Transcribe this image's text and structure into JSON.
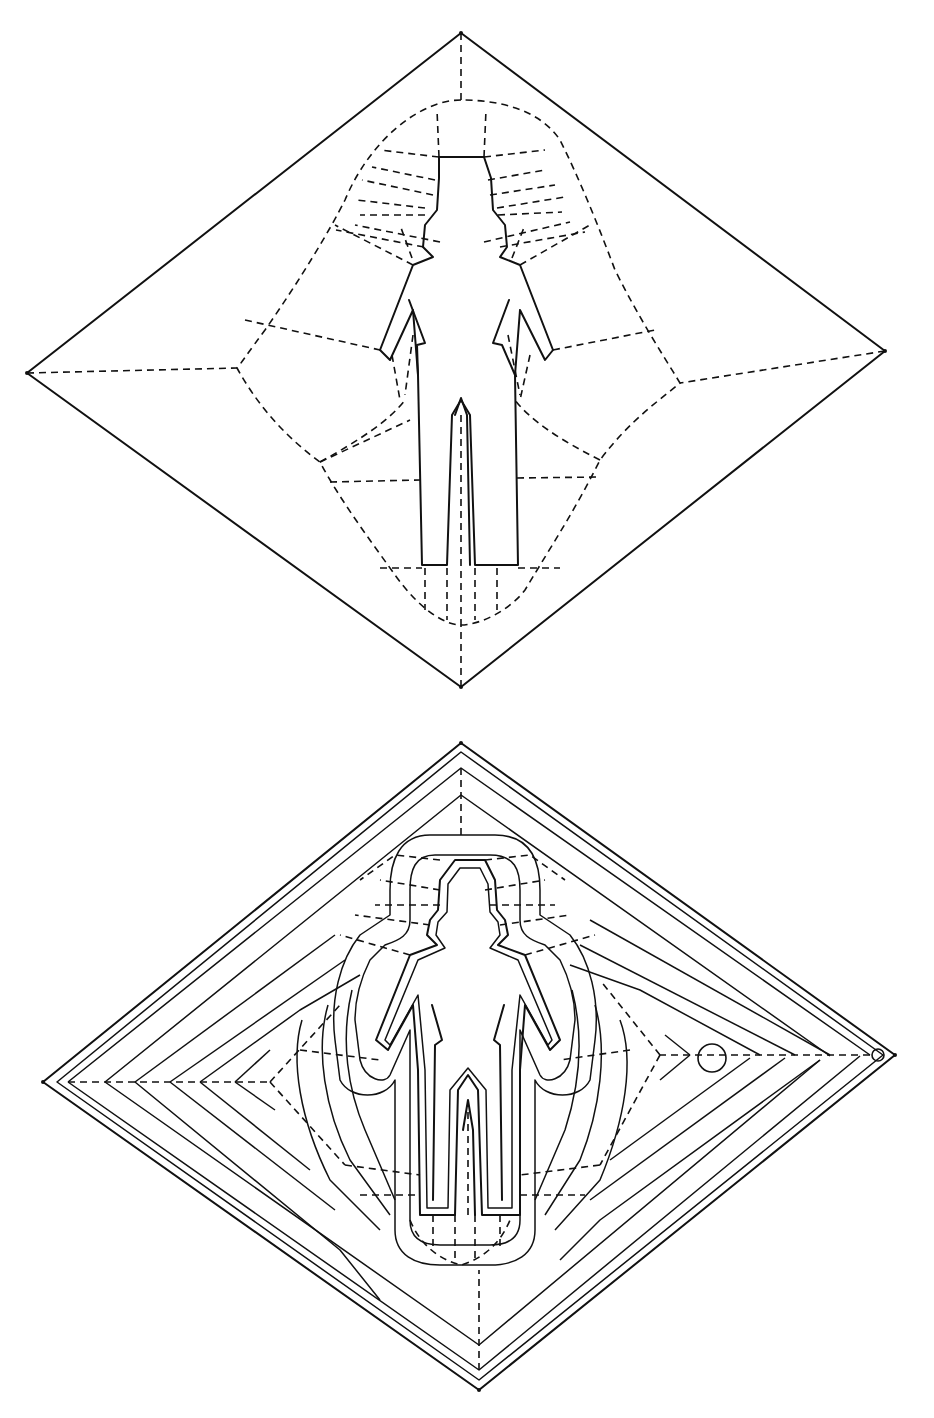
{
  "figures": [
    {
      "id": "upper-figure",
      "description": "Crease pattern: square diamond with human figure outline, dashed fold lines",
      "diamond": {
        "top": [
          461,
          33
        ],
        "right": [
          885,
          351
        ],
        "bottom": [
          461,
          687
        ],
        "left": [
          27,
          373
        ]
      },
      "colors": {
        "line": "#111111",
        "background": "#ffffff"
      }
    },
    {
      "id": "lower-figure",
      "description": "Crease pattern: nested concentric diamonds around human figure outline with contour lines",
      "diamond": {
        "top": [
          461,
          743
        ],
        "right": [
          895,
          1055
        ],
        "bottom": [
          479,
          1390
        ],
        "left": [
          43,
          1082
        ]
      },
      "markers": [
        {
          "type": "circle",
          "center": [
            712,
            1058
          ],
          "r": 14
        },
        {
          "type": "circle",
          "center": [
            878,
            1055
          ],
          "r": 6
        }
      ],
      "colors": {
        "line": "#111111",
        "background": "#ffffff"
      }
    }
  ]
}
